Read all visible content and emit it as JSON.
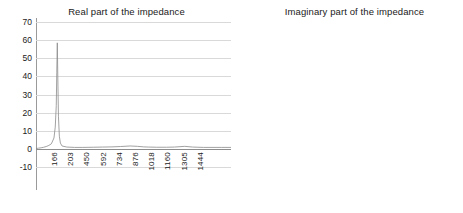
{
  "chart_data": [
    {
      "type": "line",
      "id": "real-impedance",
      "title": "Real part of the impedance",
      "xlabel": "",
      "ylabel": "",
      "ylim": [
        -10,
        70
      ],
      "yticks": [
        70,
        60,
        50,
        40,
        30,
        20,
        10,
        0,
        -10
      ],
      "grid": true,
      "legend": "none",
      "xtick_labels": [
        "166",
        "203",
        "450",
        "592",
        "734",
        "876",
        "1018",
        "1160",
        "1305",
        "1444"
      ],
      "x": [
        0,
        20,
        40,
        60,
        80,
        100,
        120,
        140,
        150,
        158,
        162,
        166,
        170,
        175,
        182,
        190,
        203,
        240,
        300,
        360,
        450,
        520,
        592,
        660,
        734,
        790,
        840,
        876,
        940,
        1018,
        1080,
        1160,
        1220,
        1305,
        1380,
        1444,
        1520
      ],
      "values": [
        0.2,
        0.4,
        0.6,
        0.9,
        1.3,
        1.9,
        2.8,
        6.0,
        12.0,
        24.0,
        42.0,
        58.5,
        40.0,
        18.0,
        7.0,
        3.2,
        1.6,
        1.0,
        0.8,
        0.8,
        0.9,
        1.0,
        1.1,
        1.3,
        1.6,
        1.4,
        1.1,
        1.0,
        0.9,
        0.9,
        1.0,
        1.4,
        1.0,
        0.8,
        0.8,
        0.8,
        0.8
      ]
    },
    {
      "type": "line",
      "id": "imaginary-impedance",
      "title": "Imaginary part of the impedance",
      "xlabel": "",
      "ylabel": "",
      "ylim": [
        -40,
        40
      ],
      "yticks": [
        40,
        30,
        20,
        10,
        0,
        -10,
        -20,
        -30,
        -40
      ],
      "grid": true,
      "legend": "none",
      "xtick_labels": [
        "138",
        "252",
        "366",
        "480",
        "594",
        "708",
        "936",
        "1050",
        "1164",
        "1278"
      ],
      "x": [
        0,
        20,
        45,
        70,
        90,
        105,
        115,
        124,
        130,
        134,
        138,
        142,
        147,
        152,
        158,
        165,
        175,
        190,
        210,
        252,
        300,
        366,
        430,
        480,
        540,
        594,
        650,
        708,
        790,
        860,
        936,
        1000,
        1050,
        1110,
        1164,
        1220,
        1278,
        1340,
        1400
      ],
      "values": [
        0.5,
        3.0,
        7.5,
        12.0,
        16.0,
        20.0,
        24.0,
        30.0,
        35.5,
        22.0,
        2.0,
        -14.0,
        -24.0,
        -28.0,
        -25.5,
        -20.0,
        -14.0,
        -9.0,
        -6.0,
        -3.6,
        -2.6,
        -2.0,
        -1.7,
        -1.5,
        -1.3,
        -1.2,
        -1.1,
        -1.0,
        -0.9,
        -0.9,
        -0.8,
        -0.8,
        -0.8,
        -0.7,
        -0.7,
        -0.7,
        -0.7,
        -0.7,
        -0.7
      ]
    }
  ]
}
